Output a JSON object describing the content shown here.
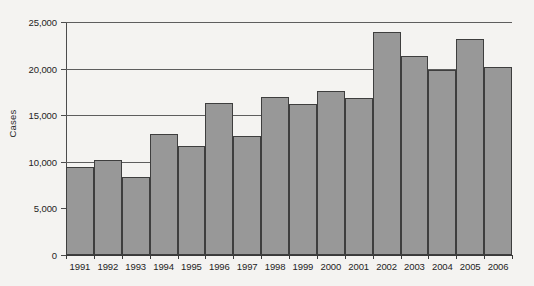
{
  "chart_data": {
    "type": "bar",
    "title": "",
    "xlabel": "",
    "ylabel": "Cases",
    "categories": [
      "1991",
      "1992",
      "1993",
      "1994",
      "1995",
      "1996",
      "1997",
      "1998",
      "1999",
      "2000",
      "2001",
      "2002",
      "2003",
      "2004",
      "2005",
      "2006"
    ],
    "values": [
      9450,
      10200,
      8400,
      12950,
      11650,
      16300,
      12800,
      16950,
      16250,
      17650,
      16900,
      23950,
      21300,
      19800,
      23200,
      20150
    ],
    "ylim": [
      0,
      25000
    ],
    "y_ticks": [
      0,
      5000,
      10000,
      15000,
      20000,
      25000
    ],
    "y_tick_labels": [
      "0",
      "5,000",
      "10,000",
      "15,000",
      "20,000",
      "25,000"
    ],
    "grid": true,
    "grid_axis": "y",
    "legend": false,
    "bar_color": "#989898",
    "bar_edge_color": "#3e3e3e",
    "axis_color": "#4c4c4c",
    "background_color": "#f4f3f1",
    "bar_gap": 0
  }
}
